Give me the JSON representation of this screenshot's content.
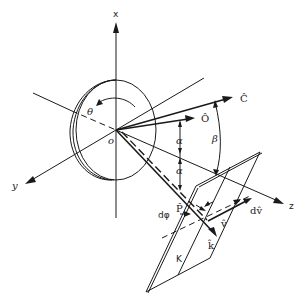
{
  "figure": {
    "type": "3D vector geometry diagram",
    "axes": {
      "x_label": "x",
      "y_label": "y",
      "z_label": "z",
      "origin_label": "o"
    },
    "vectors": {
      "C_label": "Ĉ",
      "O_label": "Ô",
      "P_label": "P̂",
      "k_label": "k̂",
      "v_label": "v̂",
      "dv_label": "dv̂"
    },
    "angles": {
      "theta_label": "θ",
      "alpha_upper_label": "α",
      "alpha_lower_label": "α",
      "beta_label": "β",
      "dphi_label": "dφ"
    },
    "plane_label": "K"
  }
}
